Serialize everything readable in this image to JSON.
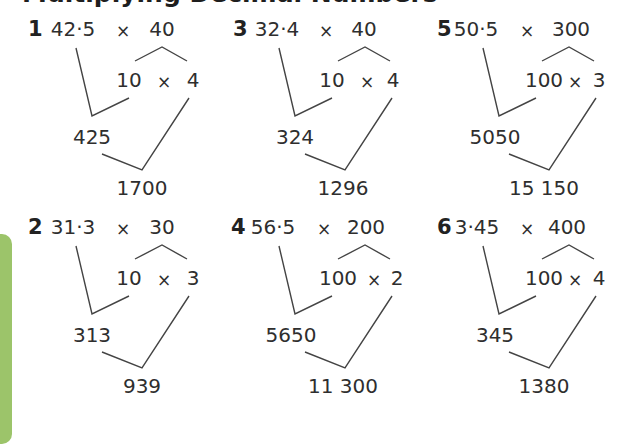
{
  "title": "Multiplying Decimal Numbers",
  "accent_color": "#9cc46a",
  "problems": [
    {
      "number": "1",
      "left": "42·5",
      "times": "×",
      "right": "40",
      "split_a": "10",
      "split_times": "×",
      "split_b": "4",
      "intermediate": "425",
      "result": "1700"
    },
    {
      "number": "2",
      "left": "31·3",
      "times": "×",
      "right": "30",
      "split_a": "10",
      "split_times": "×",
      "split_b": "3",
      "intermediate": "313",
      "result": "939"
    },
    {
      "number": "3",
      "left": "32·4",
      "times": "×",
      "right": "40",
      "split_a": "10",
      "split_times": "×",
      "split_b": "4",
      "intermediate": "324",
      "result": "1296"
    },
    {
      "number": "4",
      "left": "56·5",
      "times": "×",
      "right": "200",
      "split_a": "100",
      "split_times": "×",
      "split_b": "2",
      "intermediate": "5650",
      "result": "11 300"
    },
    {
      "number": "5",
      "left": "50·5",
      "times": "×",
      "right": "300",
      "split_a": "100",
      "split_times": "×",
      "split_b": "3",
      "intermediate": "5050",
      "result": "15 150"
    },
    {
      "number": "6",
      "left": "3·45",
      "times": "×",
      "right": "400",
      "split_a": "100",
      "split_times": "×",
      "split_b": "4",
      "intermediate": "345",
      "result": "1380"
    }
  ]
}
